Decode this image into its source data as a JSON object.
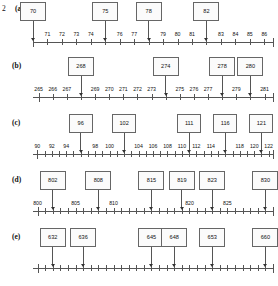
{
  "question_number": "2",
  "rows": [
    {
      "label": "(a)",
      "axis": {
        "min": 70,
        "max": 86.6,
        "tick_step": 1,
        "label_step": 1
      },
      "tick_labels": [
        "71",
        "72",
        "73",
        "74",
        "76",
        "77",
        "79",
        "80",
        "81",
        "83",
        "84",
        "85",
        "86"
      ],
      "markers": [
        {
          "value": "70"
        },
        {
          "value": "75"
        },
        {
          "value": "78"
        },
        {
          "value": "82"
        }
      ]
    },
    {
      "label": "(b)",
      "axis": {
        "min": 264.6,
        "max": 281.6,
        "tick_step": 1,
        "label_step": 1
      },
      "tick_labels": [
        "265",
        "266",
        "267",
        "269",
        "270",
        "271",
        "272",
        "273",
        "275",
        "276",
        "277",
        "279",
        "281"
      ],
      "markers": [
        {
          "value": "268"
        },
        {
          "value": "274"
        },
        {
          "value": "278"
        },
        {
          "value": "280"
        }
      ]
    },
    {
      "label": "(c)",
      "axis": {
        "min": 89.4,
        "max": 122.6,
        "tick_step": 1,
        "label_step": 2
      },
      "tick_labels": [
        "90",
        "92",
        "94",
        "98",
        "100",
        "104",
        "106",
        "108",
        "110",
        "112",
        "114",
        "118",
        "120",
        "122"
      ],
      "markers": [
        {
          "value": "96"
        },
        {
          "value": "102"
        },
        {
          "value": "111"
        },
        {
          "value": "116"
        },
        {
          "value": "121"
        }
      ]
    },
    {
      "label": "(d)",
      "axis": {
        "min": 799.4,
        "max": 831.0,
        "tick_step": 1,
        "label_step": 5
      },
      "tick_labels": [
        "800",
        "805",
        "810",
        "820",
        "825"
      ],
      "markers": [
        {
          "value": "802"
        },
        {
          "value": "808"
        },
        {
          "value": "815"
        },
        {
          "value": "819"
        },
        {
          "value": "823"
        },
        {
          "value": "830"
        }
      ]
    },
    {
      "label": "(e)",
      "axis": {
        "min": 629.4,
        "max": 661.0,
        "tick_step": 1,
        "label_step": 5
      },
      "tick_labels": [],
      "markers": [
        {
          "value": "632"
        },
        {
          "value": "636"
        },
        {
          "value": "645"
        },
        {
          "value": "648"
        },
        {
          "value": "653"
        },
        {
          "value": "660"
        }
      ]
    }
  ],
  "colors": {
    "line": "#555555",
    "box_border": "#666666",
    "box_fill": "#fbfbfb",
    "text": "#111111",
    "background": "#ffffff"
  }
}
